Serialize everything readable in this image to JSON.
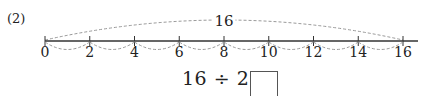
{
  "problem": {
    "number_label": "(2)",
    "total_label": "16",
    "equation": "16 ÷ 2 =",
    "answer_box_value": ""
  },
  "number_line": {
    "min": 0,
    "max": 16,
    "step": 2,
    "ticks": [
      "0",
      "2",
      "4",
      "6",
      "8",
      "10",
      "12",
      "14",
      "16"
    ],
    "line_color": "#333333",
    "dashed_arc_color": "#999999"
  }
}
